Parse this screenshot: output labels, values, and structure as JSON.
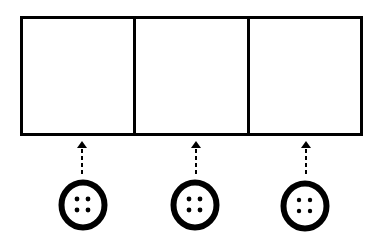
{
  "diagram": {
    "panels": [
      {
        "id": "panel-1"
      },
      {
        "id": "panel-2"
      },
      {
        "id": "panel-3"
      }
    ],
    "buttons": [
      {
        "id": "button-1",
        "icon": "button-four-holes-icon",
        "cx": 83,
        "cy": 205
      },
      {
        "id": "button-2",
        "icon": "button-four-holes-icon",
        "cx": 195,
        "cy": 205
      },
      {
        "id": "button-3",
        "icon": "button-four-holes-icon",
        "cx": 305,
        "cy": 206
      }
    ],
    "connectors": [
      {
        "style": "dashed-arrow-up",
        "x": 82
      },
      {
        "style": "dashed-arrow-up",
        "x": 196
      },
      {
        "style": "dashed-arrow-up",
        "x": 306
      }
    ],
    "colors": {
      "stroke": "#000000",
      "background": "#ffffff"
    }
  }
}
